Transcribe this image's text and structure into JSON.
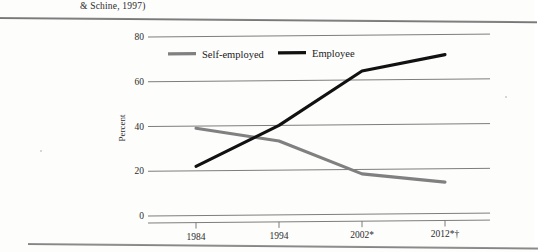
{
  "document": {
    "header_text": "& Schine, 1997)"
  },
  "chart_data": {
    "type": "line",
    "title": "",
    "xlabel": "",
    "ylabel": "Percent",
    "categories": [
      "1984",
      "1994",
      "2002*",
      "2012*†"
    ],
    "ylim": [
      0,
      80
    ],
    "yticks": [
      "0",
      "20",
      "40",
      "60",
      "80"
    ],
    "ytick_values": [
      0,
      20,
      40,
      60,
      80
    ],
    "grid": true,
    "legend_position": "top",
    "series": [
      {
        "name": "Self-employed",
        "color": "#808080",
        "values": [
          39,
          33,
          18,
          14
        ]
      },
      {
        "name": "Employee",
        "color": "#111111",
        "values": [
          22,
          40,
          64,
          71
        ]
      }
    ]
  },
  "legend": {
    "items": [
      {
        "label": "Self-employed",
        "color": "#808080"
      },
      {
        "label": "Employee",
        "color": "#111111"
      }
    ]
  }
}
